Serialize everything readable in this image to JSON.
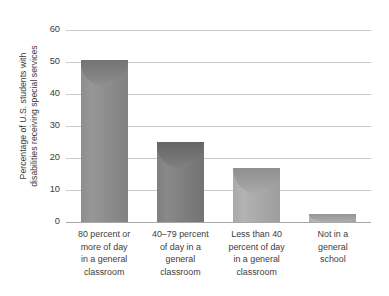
{
  "chart_data": {
    "type": "bar",
    "title": "",
    "subtitle": "",
    "xlabel": "",
    "ylabel": "Percentage of U.S. students with disabilities receiving special services",
    "ylabel_lines": [
      "Percentage of U.S. students with",
      "disabilities receiving special services"
    ],
    "categories": [
      "80 percent or more of day in a general classroom",
      "40–79 percent of day in a general classroom",
      "Less than 40 percent of day in a general classroom",
      "Not in a general school"
    ],
    "category_lines": [
      [
        "80 percent or",
        "more of day",
        "in a general",
        "classroom"
      ],
      [
        "40–79 percent",
        "of day in a",
        "general",
        "classroom"
      ],
      [
        "Less than 40",
        "percent of day",
        "in a general",
        "classroom"
      ],
      [
        "Not in a",
        "general",
        "school"
      ]
    ],
    "values": [
      50.5,
      25,
      17,
      2.5
    ],
    "ylim": [
      0,
      60
    ],
    "yticks": [
      0,
      10,
      20,
      30,
      40,
      50,
      60
    ],
    "ytick_labels": [
      "0",
      "10",
      "20",
      "30",
      "40",
      "50",
      "60"
    ],
    "grid": true,
    "legend": false,
    "legend_position": "none",
    "bar_colors": [
      "#8d8d8d",
      "#7f7f7f",
      "#a9a9a9",
      "#b0b0b0"
    ],
    "gridline_color": "#c9c9c9",
    "axis_color": "#a8a8a8",
    "text_color": "#3c3c3c",
    "background": "#ffffff"
  }
}
